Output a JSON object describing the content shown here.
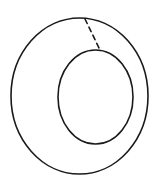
{
  "figure": {
    "canvas": {
      "width": 161,
      "height": 193,
      "background_color": "#ffffff"
    },
    "stroke_color": "#1a1a1a",
    "shapes": {
      "outer_circle": {
        "name": "outer-circle",
        "center_x": 79.5,
        "center_y": 96,
        "radius_x": 68.5,
        "radius_y": 78,
        "stroke_width": 1.6,
        "style": "solid"
      },
      "inner_circle": {
        "name": "inner-circle",
        "center_x": 95.5,
        "center_y": 97,
        "radius_x": 37.5,
        "radius_y": 47,
        "stroke_width": 1.6,
        "style": "solid"
      },
      "dashed_line": {
        "name": "dashed-radius-line",
        "x1": 85,
        "y1": 19,
        "x2": 100,
        "y2": 50,
        "stroke_width": 1.6,
        "style": "dashed",
        "dash_pattern": "5 4"
      }
    }
  }
}
